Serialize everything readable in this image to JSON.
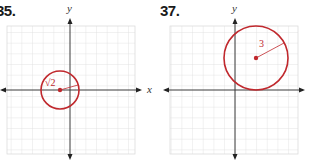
{
  "problems": [
    {
      "number": "35.",
      "x_axis_label": "x",
      "y_axis_label": "y",
      "circle": {
        "center": [
          -1,
          0
        ],
        "radius_label": "√2"
      }
    },
    {
      "number": "37.",
      "x_axis_label": "",
      "y_axis_label": "y",
      "circle": {
        "center": [
          2,
          3
        ],
        "radius_label": "3"
      }
    }
  ],
  "colors": {
    "circle": "#c0282d",
    "axis": "#3a3a3a",
    "grid": "#dcdcdc"
  }
}
